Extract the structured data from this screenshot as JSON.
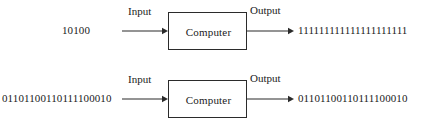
{
  "figure": {
    "stroke_color": "#2b2b2b",
    "text_color": "#1a1a1a",
    "background_color": "#ffffff"
  },
  "diagrams": [
    {
      "id": "diagram-top",
      "input_value": "10100",
      "input_label": "Input",
      "box_label": "Computer",
      "output_label": "Output",
      "output_value": "111111111111111111111"
    },
    {
      "id": "diagram-bottom",
      "input_value": "01101100110111100010",
      "input_label": "Input",
      "box_label": "Computer",
      "output_label": "Output",
      "output_value": "01101100110111100010"
    }
  ]
}
